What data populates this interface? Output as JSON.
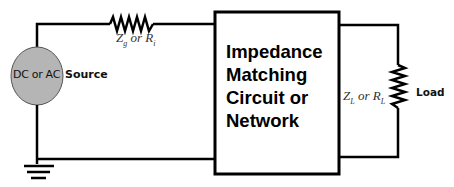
{
  "diagram": {
    "type": "circuit-schematic",
    "source": {
      "label_inner": "DC or AC",
      "label_outer": "Source",
      "fill_color": "#b5b5b5"
    },
    "source_resistor": {
      "symbol_main": "Z",
      "symbol_sub": "g",
      "connector": " or ",
      "alt_main": "R",
      "alt_sub": "i"
    },
    "matching_network": {
      "lines": [
        "Impedance",
        "Matching",
        "Circuit or",
        "Network"
      ]
    },
    "load_resistor": {
      "symbol_main": "Z",
      "symbol_sub": "L",
      "connector": " or ",
      "alt_main": "R",
      "alt_sub": "L",
      "label": "Load"
    },
    "ground": "ground-symbol",
    "wire_color": "#000000"
  }
}
